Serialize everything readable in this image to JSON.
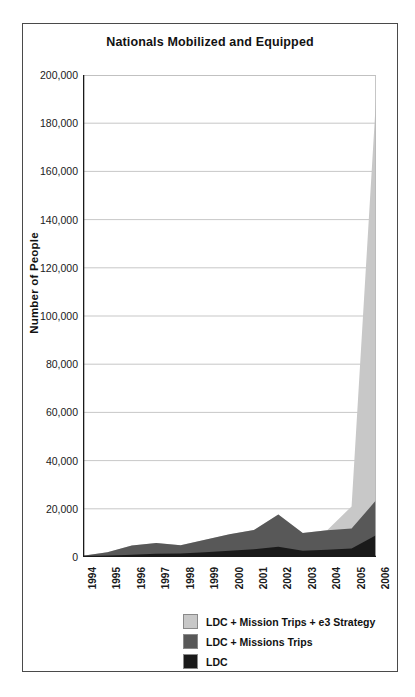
{
  "chart_data": {
    "type": "area",
    "title": "Nationals Mobilized and Equipped",
    "xlabel": "",
    "ylabel": "Number of People",
    "stacked": true,
    "grid": true,
    "legend_position": "bottom-right",
    "categories": [
      "1994",
      "1995",
      "1996",
      "1997",
      "1998",
      "1999",
      "2000",
      "2001",
      "2002",
      "2003",
      "2004",
      "2005",
      "2006"
    ],
    "ylim": [
      0,
      200000
    ],
    "yticks": [
      0,
      20000,
      40000,
      60000,
      80000,
      100000,
      120000,
      140000,
      160000,
      180000,
      200000
    ],
    "ytick_labels": [
      "0",
      "20,000",
      "40,000",
      "60,000",
      "80,000",
      "100,000",
      "120,000",
      "140,000",
      "160,000",
      "180,000",
      "200,000"
    ],
    "series": [
      {
        "name": "LDC",
        "color": "#1a1a1a",
        "values": [
          200,
          500,
          900,
          1400,
          1500,
          2000,
          2600,
          3200,
          4300,
          2600,
          3000,
          3500,
          9000
        ]
      },
      {
        "name": "LDC + Missions Trips",
        "color": "#585858",
        "values": [
          300,
          1500,
          3900,
          4400,
          3400,
          5200,
          6800,
          8000,
          13300,
          7400,
          8100,
          8300,
          14500
        ]
      },
      {
        "name": "LDC + Mission Trips + e3 Strategy",
        "color": "#c8c8c8",
        "values": [
          0,
          0,
          0,
          0,
          0,
          0,
          0,
          0,
          0,
          0,
          0,
          9200,
          166500
        ]
      }
    ]
  },
  "legend": {
    "items": [
      {
        "label": "LDC + Mission Trips + e3 Strategy",
        "color": "#c8c8c8"
      },
      {
        "label": "LDC + Missions Trips",
        "color": "#585858"
      },
      {
        "label": "LDC",
        "color": "#1a1a1a"
      }
    ]
  }
}
